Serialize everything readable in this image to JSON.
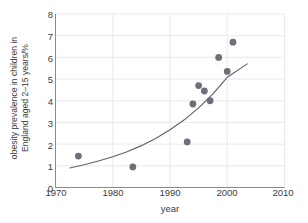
{
  "chart_data": {
    "type": "scatter",
    "title": "",
    "xlabel": "year",
    "ylabel_line1": "obesity prevalence in children in",
    "ylabel_line2": "England aged 2–15 years/%",
    "xlim": [
      1970,
      2010
    ],
    "ylim": [
      0,
      8
    ],
    "xticks": [
      1970,
      1980,
      1990,
      2000,
      2010
    ],
    "yticks": [
      0,
      1,
      2,
      3,
      4,
      5,
      6,
      7,
      8
    ],
    "grid": true,
    "legend": "none",
    "points": [
      {
        "x": 1974.0,
        "y": 1.45
      },
      {
        "x": 1983.5,
        "y": 0.95
      },
      {
        "x": 1993.0,
        "y": 2.1
      },
      {
        "x": 1994.0,
        "y": 3.85
      },
      {
        "x": 1995.0,
        "y": 4.7
      },
      {
        "x": 1996.0,
        "y": 4.45
      },
      {
        "x": 1997.0,
        "y": 4.0
      },
      {
        "x": 1998.5,
        "y": 6.0
      },
      {
        "x": 2000.0,
        "y": 5.35
      },
      {
        "x": 2001.0,
        "y": 6.7
      }
    ],
    "series": [
      {
        "name": "fitted exponential trend",
        "type": "line",
        "x": [
          1972.5,
          1975,
          1977.5,
          1980,
          1982.5,
          1985,
          1987.5,
          1990,
          1992.5,
          1995,
          1997.5,
          2000,
          2003.5
        ],
        "y": [
          0.9,
          1.05,
          1.22,
          1.42,
          1.65,
          1.93,
          2.26,
          2.66,
          3.12,
          3.67,
          4.32,
          5.08,
          5.7
        ]
      }
    ],
    "marker_color": "#6b7079",
    "line_color": "#5e636b",
    "grid_color": "#e6e6e6",
    "axis_color": "#8a8a8a",
    "text_color": "#3d3d3d",
    "background": "#ffffff"
  }
}
